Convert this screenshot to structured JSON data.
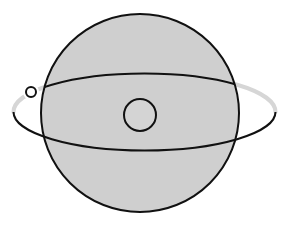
{
  "diagram": {
    "canvas": {
      "width": 295,
      "height": 230,
      "background": "#ffffff"
    },
    "sphere": {
      "cx": 140,
      "cy": 113,
      "r": 99,
      "fill": "#cfcfcf",
      "stroke": "#111111",
      "stroke_width": 2
    },
    "orbit": {
      "cx": 144.5,
      "cy": 112,
      "rx": 131,
      "ry": 38.5,
      "front_stroke": "#111111",
      "back_inside_stroke": "#111111",
      "back_outside_stroke": "#d6d6d6",
      "stroke_width": 2,
      "back_outside_stroke_width": 4
    },
    "central_body": {
      "cx": 140,
      "cy": 115,
      "r": 16,
      "fill": "#d4d4d4",
      "stroke": "#111111",
      "stroke_width": 2
    },
    "orbiting_body": {
      "cx": 31,
      "cy": 92,
      "r": 5,
      "fill": "#ffffff",
      "stroke": "#111111",
      "stroke_width": 2
    }
  }
}
